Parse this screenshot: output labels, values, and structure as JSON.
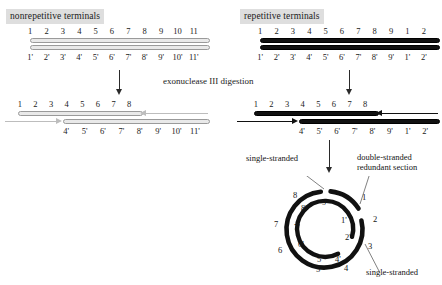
{
  "figure": {
    "caption": "exonuclease III digestion"
  },
  "left_panel": {
    "title": "nonrepetitive terminals",
    "duplex_top_numbers": [
      "1",
      "2",
      "3",
      "4",
      "5",
      "6",
      "7",
      "8",
      "9",
      "10",
      "11"
    ],
    "duplex_bottom_numbers": [
      "1'",
      "2'",
      "3'",
      "4'",
      "5'",
      "6'",
      "7'",
      "8'",
      "9'",
      "10'",
      "11'"
    ],
    "digested_top_numbers": [
      "1",
      "2",
      "3",
      "4",
      "5",
      "6",
      "7",
      "8"
    ],
    "digested_bottom_numbers": [
      "4'",
      "5'",
      "6'",
      "7'",
      "8'",
      "9'",
      "10'",
      "11'"
    ],
    "strand_color": "#e9e9e9",
    "strand_border": "#9a9a9a",
    "arrow_color": "#bdbdbd"
  },
  "right_panel": {
    "title": "repetitive terminals",
    "duplex_top_numbers": [
      "1",
      "2",
      "3",
      "4",
      "5",
      "6",
      "7",
      "8",
      "9",
      "1",
      "2"
    ],
    "duplex_bottom_numbers": [
      "1'",
      "2'",
      "3'",
      "4'",
      "5'",
      "6'",
      "7'",
      "8'",
      "9'",
      "1'",
      "2'"
    ],
    "digested_top_numbers": [
      "1",
      "2",
      "3",
      "4",
      "5",
      "6",
      "7",
      "8"
    ],
    "digested_bottom_numbers": [
      "4'",
      "5'",
      "6'",
      "7'",
      "8'",
      "9'",
      "1'",
      "2'"
    ],
    "strand_color": "#111111",
    "arrow_color": "#111111"
  },
  "circle": {
    "outer_numbers": [
      "1",
      "2",
      "3",
      "4",
      "5",
      "6",
      "7",
      "8"
    ],
    "inner_numbers": [
      "1'",
      "2'",
      "4'",
      "5'",
      "6'",
      "7'",
      "8'",
      "9'"
    ],
    "annotations": {
      "single_stranded_top": "single-stranded",
      "double_stranded_redundant": "double-stranded\nredundant section",
      "double_stranded_line1": "double-stranded",
      "double_stranded_line2": "redundant section",
      "single_stranded_bottom": "single-stranded"
    },
    "stroke_color": "#111111"
  }
}
